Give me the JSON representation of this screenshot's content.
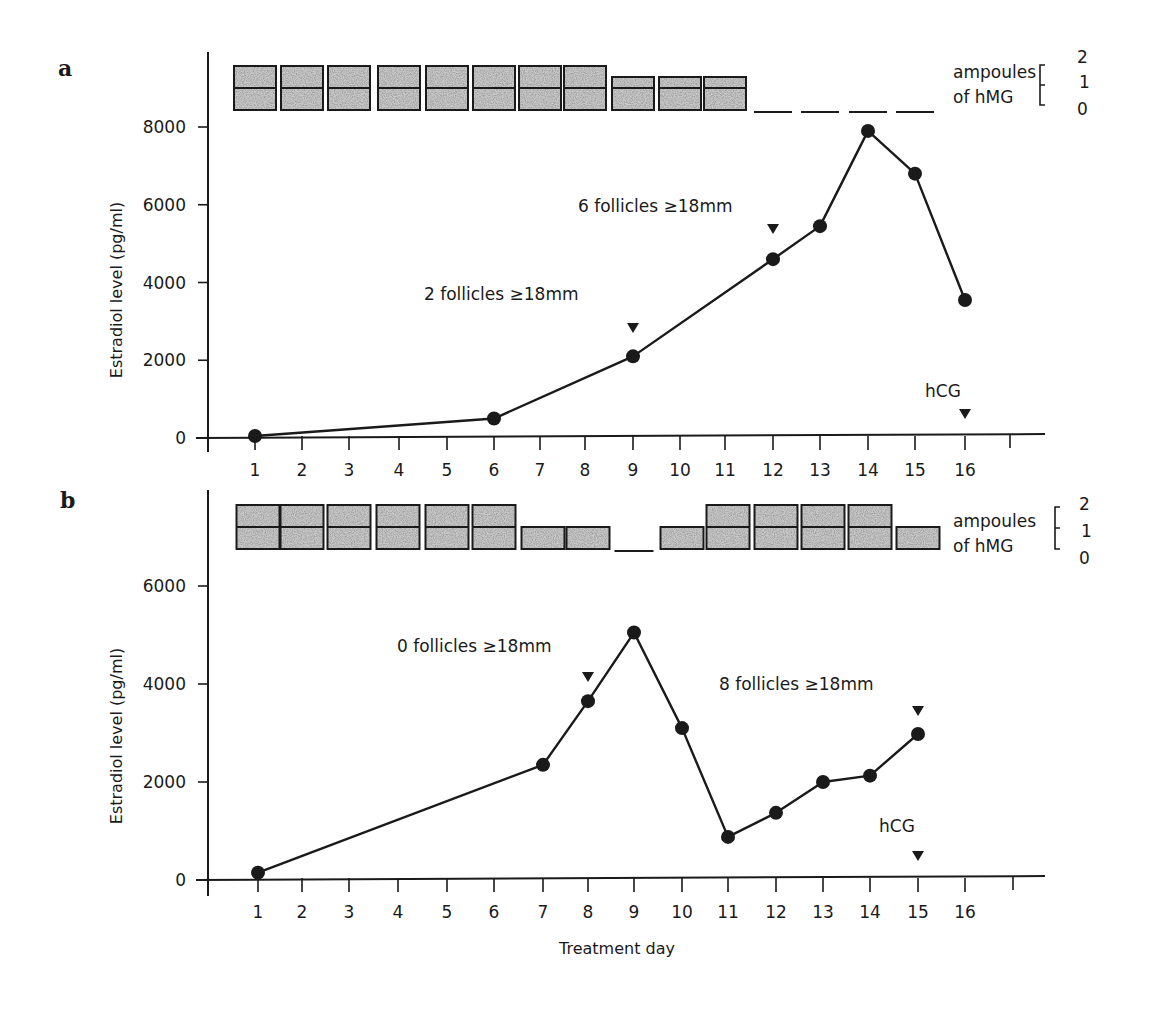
{
  "figure": {
    "xlabel": "Treatment day",
    "ylabel": "Estradiol level (pg/ml)",
    "ampoule_legend": {
      "line1": "ampoules",
      "line2": "of hMG",
      "levels": [
        "2",
        "1",
        "0"
      ]
    },
    "colors": {
      "ink": "#1a1a1a",
      "stipple": "#c8c8c8"
    }
  },
  "chart_data": [
    {
      "panel": "a",
      "type": "line",
      "title": "",
      "xlabel": "",
      "ylabel": "Estradiol level (pg/ml)",
      "x_ticks": [
        "1",
        "2",
        "3",
        "4",
        "5",
        "6",
        "7",
        "8",
        "9",
        "10",
        "11",
        "12",
        "13",
        "14",
        "15",
        "16"
      ],
      "y_ticks": [
        "0",
        "2000",
        "4000",
        "6000",
        "8000"
      ],
      "ylim": [
        0,
        8000
      ],
      "grid": false,
      "series": [
        {
          "name": "Estradiol",
          "x": [
            1,
            6,
            9,
            12,
            13,
            14,
            15,
            16
          ],
          "y": [
            50,
            500,
            2100,
            4600,
            5450,
            7900,
            6800,
            3550
          ]
        }
      ],
      "ampoules_hMG": {
        "days": [
          1,
          2,
          3,
          4,
          5,
          6,
          7,
          8,
          9,
          10,
          11,
          12,
          13,
          14,
          15
        ],
        "values": [
          2,
          2,
          2,
          2,
          2,
          2,
          2,
          2,
          1.5,
          1.5,
          1.5,
          0,
          0,
          0,
          0
        ]
      },
      "annotations": [
        {
          "text": "2 follicles ≥18mm",
          "x_px": 424,
          "y_px": 300
        },
        {
          "text": "6 follicles ≥18mm",
          "x_px": 578,
          "y_px": 212
        },
        {
          "text": "hCG",
          "x_px": 925,
          "y_px": 397
        }
      ],
      "markers": [
        {
          "type": "triangle-down",
          "day": 9,
          "y_px": 328
        },
        {
          "type": "triangle-down",
          "day": 12,
          "y_px": 229
        },
        {
          "type": "triangle-down",
          "day": 16,
          "y_px": 414,
          "label": "hCG"
        }
      ]
    },
    {
      "panel": "b",
      "type": "line",
      "title": "",
      "xlabel": "Treatment day",
      "ylabel": "Estradiol level (pg/ml)",
      "x_ticks": [
        "1",
        "2",
        "3",
        "4",
        "5",
        "6",
        "7",
        "8",
        "9",
        "10",
        "11",
        "12",
        "13",
        "14",
        "15",
        "16"
      ],
      "y_ticks": [
        "0",
        "2000",
        "4000",
        "6000"
      ],
      "ylim": [
        0,
        6000
      ],
      "grid": false,
      "series": [
        {
          "name": "Estradiol",
          "x": [
            1,
            7,
            8,
            9,
            10,
            11,
            12,
            13,
            14,
            15
          ],
          "y": [
            150,
            2350,
            3650,
            5050,
            3100,
            880,
            1370,
            2000,
            2130,
            2980
          ]
        }
      ],
      "ampoules_hMG": {
        "days": [
          1,
          2,
          3,
          4,
          5,
          6,
          7,
          8,
          9,
          10,
          11,
          12,
          13,
          14,
          15
        ],
        "values": [
          2,
          2,
          2,
          2,
          2,
          2,
          1,
          1,
          0,
          1,
          2,
          2,
          2,
          2,
          1
        ]
      },
      "annotations": [
        {
          "text": "0 follicles ≥18mm",
          "x_px": 397,
          "y_px": 652
        },
        {
          "text": "8 follicles ≥18mm",
          "x_px": 719,
          "y_px": 690
        },
        {
          "text": "hCG",
          "x_px": 879,
          "y_px": 832
        }
      ],
      "markers": [
        {
          "type": "triangle-down",
          "day": 8,
          "y_px": 677
        },
        {
          "type": "triangle-down",
          "day": 15,
          "y_px": 711
        },
        {
          "type": "triangle-down",
          "day": 15,
          "y_px": 856,
          "label": "hCG"
        }
      ]
    }
  ],
  "panels": {
    "a": {
      "letter": "a"
    },
    "b": {
      "letter": "b"
    }
  }
}
